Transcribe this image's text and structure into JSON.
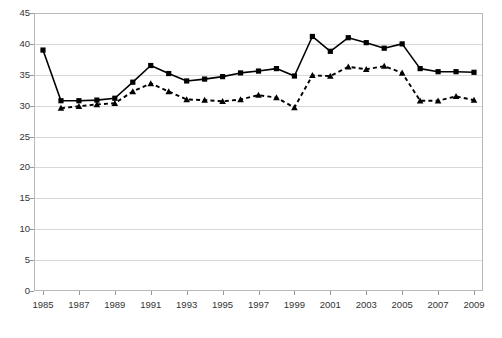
{
  "chart_data": {
    "type": "line",
    "title": "",
    "subtitle": "",
    "xlabel": "",
    "ylabel": "",
    "xlim": [
      1985,
      2009
    ],
    "ylim": [
      0,
      45
    ],
    "ytick_step": 5,
    "yticks": [
      0,
      5,
      10,
      15,
      20,
      25,
      30,
      35,
      40,
      45
    ],
    "xticks": [
      1985,
      1987,
      1989,
      1991,
      1993,
      1995,
      1997,
      1999,
      2001,
      2003,
      2005,
      2007,
      2009
    ],
    "x": [
      1985,
      1986,
      1987,
      1988,
      1989,
      1990,
      1991,
      1992,
      1993,
      1994,
      1995,
      1996,
      1997,
      1998,
      1999,
      2000,
      2001,
      2002,
      2003,
      2004,
      2005,
      2006,
      2007,
      2008,
      2009
    ],
    "grid": true,
    "grid_axis": "y",
    "legend": false,
    "legend_position": "none",
    "series": [
      {
        "name": "series-solid-squares",
        "line_style": "solid",
        "marker": "square",
        "color": "#000000",
        "values": [
          39.0,
          30.8,
          30.8,
          30.9,
          31.2,
          33.8,
          36.5,
          35.2,
          34.0,
          34.3,
          34.7,
          35.3,
          35.6,
          36.0,
          34.8,
          41.2,
          38.8,
          41.0,
          40.2,
          39.3,
          40.0,
          36.0,
          35.5,
          35.5,
          35.4
        ]
      },
      {
        "name": "series-dashed-triangles",
        "line_style": "dashed",
        "marker": "triangle",
        "color": "#000000",
        "values": [
          null,
          29.6,
          29.9,
          30.2,
          30.4,
          32.3,
          33.6,
          32.3,
          31.0,
          30.9,
          30.7,
          31.0,
          31.7,
          31.3,
          29.7,
          34.9,
          34.8,
          36.3,
          35.9,
          36.4,
          35.3,
          30.8,
          30.8,
          31.5,
          30.9
        ]
      }
    ]
  },
  "axes": {
    "y_tick_labels": [
      "45",
      "40",
      "35",
      "30",
      "25",
      "20",
      "15",
      "10",
      "5",
      "0"
    ],
    "x_tick_labels": [
      "1985",
      "1987",
      "1989",
      "1991",
      "1993",
      "1995",
      "1997",
      "1999",
      "2001",
      "2003",
      "2005",
      "2007",
      "2009"
    ]
  },
  "style": {
    "grid_color": "#d8d8d8",
    "axis_color": "#888888",
    "frame_color": "#b9b9b9",
    "series_color": "#000000",
    "background": "#ffffff"
  }
}
